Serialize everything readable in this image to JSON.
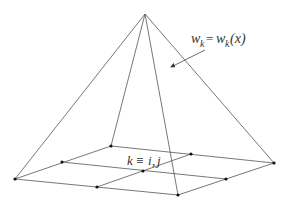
{
  "diagram": {
    "title": "",
    "labels": {
      "weight_function": {
        "w": "w",
        "k": "k",
        "eq": "=",
        "rhs_w": "w",
        "rhs_k": "k",
        "rhs_arg": "(x)"
      },
      "node_index": {
        "k": "k",
        "equiv": "≡",
        "i": "i",
        "comma": ",",
        "j": "j"
      }
    },
    "apex": [
      145,
      14
    ],
    "grid_nodes": {
      "left": [
        15,
        179
      ],
      "back": [
        111,
        146
      ],
      "right": [
        274,
        163
      ],
      "front": [
        178,
        195
      ],
      "left_back_mid": [
        62,
        162
      ],
      "back_right_mid": [
        191,
        154
      ],
      "right_front_mid": [
        226,
        179
      ],
      "front_left_mid": [
        97,
        187
      ],
      "center": [
        143,
        171
      ]
    },
    "colors": {
      "line": "#555555",
      "node": "#111111",
      "text": "#333333"
    }
  }
}
